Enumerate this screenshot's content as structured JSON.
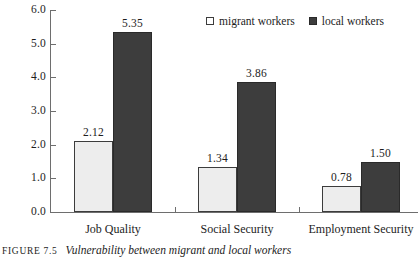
{
  "chart_data": {
    "type": "bar",
    "title": "",
    "xlabel": "",
    "ylabel": "",
    "categories": [
      "Job Quality",
      "Social Security",
      "Employment Security"
    ],
    "series": [
      {
        "name": "migrant workers",
        "values": [
          2.12,
          1.34,
          0.78
        ],
        "color": "#ededed"
      },
      {
        "name": "local workers",
        "values": [
          5.35,
          3.86,
          1.5
        ],
        "color": "#3d3d3d"
      }
    ],
    "value_labels": [
      [
        "2.12",
        "1.34",
        "0.78"
      ],
      [
        "5.35",
        "3.86",
        "1.50"
      ]
    ],
    "ylim": [
      0,
      6
    ],
    "yticks": [
      0,
      1,
      2,
      3,
      4,
      5,
      6
    ],
    "ytick_labels": [
      "0.0",
      "1.0",
      "2.0",
      "3.0",
      "4.0",
      "5.0",
      "6.0"
    ],
    "grid": false,
    "legend_position": "top-right"
  },
  "legend": {
    "items": [
      {
        "label": "migrant workers",
        "swatch": "open-square-icon"
      },
      {
        "label": "local workers",
        "swatch": "filled-square-icon"
      }
    ]
  },
  "caption": {
    "tag": "Figure 7.5",
    "text": "Vulnerability between migrant and local workers"
  }
}
